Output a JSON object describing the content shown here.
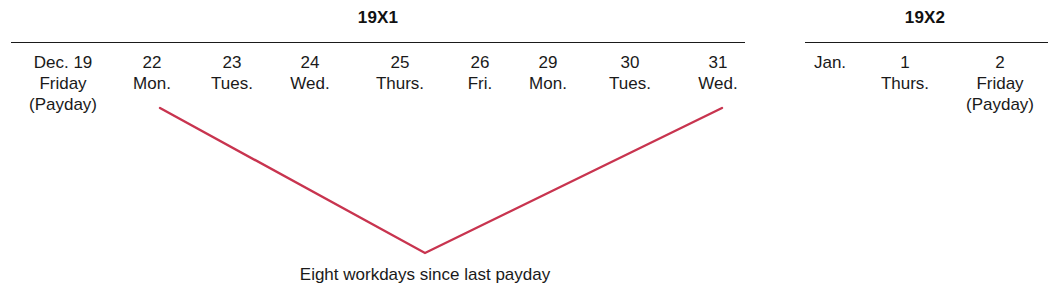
{
  "figure": {
    "background_color": "#ffffff",
    "text_color": "#1a1a1a",
    "rule_color": "#1a1a1a",
    "accent_color": "#C8344F",
    "caption": "Eight workdays since last payday"
  },
  "groups": [
    {
      "heading": "19X1",
      "columns": [
        {
          "date": "Dec. 19",
          "day": "Friday",
          "note": "(Payday)"
        },
        {
          "date": "22",
          "day": "Mon.",
          "note": ""
        },
        {
          "date": "23",
          "day": "Tues.",
          "note": ""
        },
        {
          "date": "24",
          "day": "Wed.",
          "note": ""
        },
        {
          "date": "25",
          "day": "Thurs.",
          "note": ""
        },
        {
          "date": "26",
          "day": "Fri.",
          "note": ""
        },
        {
          "date": "29",
          "day": "Mon.",
          "note": ""
        },
        {
          "date": "30",
          "day": "Tues.",
          "note": ""
        },
        {
          "date": "31",
          "day": "Wed.",
          "note": ""
        }
      ]
    },
    {
      "heading": "19X2",
      "columns": [
        {
          "date": "Jan.",
          "day": "",
          "note": ""
        },
        {
          "date": "1",
          "day": "Thurs.",
          "note": ""
        },
        {
          "date": "2",
          "day": "Friday",
          "note": "(Payday)"
        }
      ]
    }
  ],
  "connector": {
    "start_label": "22 Mon.",
    "vertex_label": "Eight workdays since last payday",
    "end_label": "31 Wed.",
    "color": "#C8344F"
  }
}
